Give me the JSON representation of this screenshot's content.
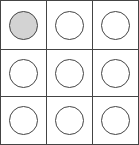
{
  "board": {
    "rows": 3,
    "cols": 3,
    "colors": {
      "line": "#444444",
      "filled": "#d3d3d3",
      "empty": "#ffffff"
    },
    "cells": [
      {
        "row": 0,
        "col": 0,
        "state": "filled"
      },
      {
        "row": 0,
        "col": 1,
        "state": "empty"
      },
      {
        "row": 0,
        "col": 2,
        "state": "empty"
      },
      {
        "row": 1,
        "col": 0,
        "state": "empty"
      },
      {
        "row": 1,
        "col": 1,
        "state": "empty"
      },
      {
        "row": 1,
        "col": 2,
        "state": "empty"
      },
      {
        "row": 2,
        "col": 0,
        "state": "empty"
      },
      {
        "row": 2,
        "col": 1,
        "state": "empty"
      },
      {
        "row": 2,
        "col": 2,
        "state": "empty"
      }
    ]
  }
}
